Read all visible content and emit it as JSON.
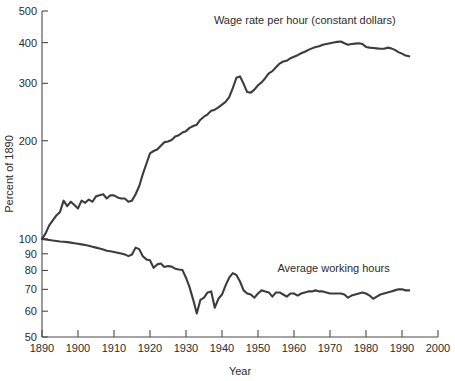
{
  "chart_data": {
    "type": "line",
    "title": "",
    "xlabel": "Year",
    "ylabel": "Percent of 1890",
    "yscale": "log",
    "xlim": [
      1890,
      2000
    ],
    "ylim": [
      50,
      500
    ],
    "grid": false,
    "legend_position": "inline-annotation",
    "xticks": [
      1890,
      1900,
      1910,
      1920,
      1930,
      1940,
      1950,
      1960,
      1970,
      1980,
      1990,
      2000
    ],
    "xtick_labels": [
      "1890",
      "1900",
      "1910",
      "1920",
      "1930",
      "1940",
      "1950",
      "1960",
      "1970",
      "1980",
      "1990",
      "2000"
    ],
    "yticks": [
      50,
      60,
      70,
      80,
      90,
      100,
      200,
      300,
      400,
      500
    ],
    "ytick_labels": [
      "50",
      "60",
      "70",
      "80",
      "90",
      "100",
      "200",
      "300",
      "400",
      "500"
    ],
    "series": [
      {
        "name": "Wage rate per hour (constant dollars)",
        "color": "#3c3c3c",
        "label_x": 1963,
        "label_y": 455,
        "x": [
          1890,
          1891,
          1892,
          1893,
          1894,
          1895,
          1896,
          1897,
          1898,
          1899,
          1900,
          1901,
          1902,
          1903,
          1904,
          1905,
          1906,
          1907,
          1908,
          1909,
          1910,
          1911,
          1912,
          1913,
          1914,
          1915,
          1916,
          1917,
          1918,
          1919,
          1920,
          1921,
          1922,
          1923,
          1924,
          1925,
          1926,
          1927,
          1928,
          1929,
          1930,
          1931,
          1932,
          1933,
          1934,
          1935,
          1936,
          1937,
          1938,
          1939,
          1940,
          1941,
          1942,
          1943,
          1944,
          1945,
          1946,
          1947,
          1948,
          1949,
          1950,
          1951,
          1952,
          1953,
          1954,
          1955,
          1956,
          1957,
          1958,
          1959,
          1960,
          1961,
          1962,
          1963,
          1964,
          1965,
          1966,
          1967,
          1968,
          1969,
          1970,
          1971,
          1972,
          1973,
          1974,
          1975,
          1976,
          1977,
          1978,
          1979,
          1980,
          1981,
          1982,
          1983,
          1984,
          1985,
          1986,
          1987,
          1988,
          1989,
          1990,
          1991,
          1992
        ],
        "y": [
          100,
          104,
          110,
          114,
          118,
          121,
          131,
          126,
          130,
          127,
          124,
          131,
          129,
          132,
          130,
          135,
          136,
          137,
          133,
          136,
          136,
          134,
          133,
          133,
          130,
          131,
          137,
          145,
          158,
          170,
          183,
          186,
          188,
          193,
          198,
          199,
          201,
          206,
          208,
          212,
          214,
          219,
          222,
          224,
          232,
          237,
          241,
          247,
          249,
          253,
          258,
          263,
          272,
          290,
          312,
          315,
          299,
          282,
          281,
          287,
          296,
          302,
          311,
          322,
          327,
          336,
          345,
          350,
          352,
          358,
          362,
          366,
          371,
          375,
          380,
          384,
          388,
          390,
          394,
          396,
          398,
          400,
          402,
          403,
          398,
          394,
          396,
          397,
          398,
          396,
          388,
          386,
          385,
          384,
          383,
          383,
          386,
          384,
          380,
          374,
          370,
          365,
          363
        ]
      },
      {
        "name": "Average working hours",
        "color": "#3c3c3c",
        "label_x": 1971,
        "label_y": 79,
        "x": [
          1890,
          1891,
          1892,
          1893,
          1894,
          1895,
          1896,
          1897,
          1898,
          1899,
          1900,
          1901,
          1902,
          1903,
          1904,
          1905,
          1906,
          1907,
          1908,
          1909,
          1910,
          1911,
          1912,
          1913,
          1914,
          1915,
          1916,
          1917,
          1918,
          1919,
          1920,
          1921,
          1922,
          1923,
          1924,
          1925,
          1926,
          1927,
          1928,
          1929,
          1930,
          1931,
          1932,
          1933,
          1934,
          1935,
          1936,
          1937,
          1938,
          1939,
          1940,
          1941,
          1942,
          1943,
          1944,
          1945,
          1946,
          1947,
          1948,
          1949,
          1950,
          1951,
          1952,
          1953,
          1954,
          1955,
          1956,
          1957,
          1958,
          1959,
          1960,
          1961,
          1962,
          1963,
          1964,
          1965,
          1966,
          1967,
          1968,
          1969,
          1970,
          1971,
          1972,
          1973,
          1974,
          1975,
          1976,
          1977,
          1978,
          1979,
          1980,
          1981,
          1982,
          1983,
          1984,
          1985,
          1986,
          1987,
          1988,
          1989,
          1990,
          1991,
          1992
        ],
        "y": [
          100,
          99.6,
          99.2,
          98.8,
          98.5,
          98.2,
          98,
          97.7,
          97.4,
          97,
          96.6,
          96.2,
          95.7,
          95.2,
          94.6,
          94,
          93.4,
          92.7,
          92,
          91.6,
          91.2,
          90.7,
          90.2,
          89.6,
          88.5,
          89.5,
          94,
          93,
          88.5,
          86.5,
          86,
          81.5,
          83.5,
          84,
          82,
          82.5,
          82.2,
          81,
          80.5,
          80.3,
          76,
          71,
          65,
          59,
          65,
          66,
          68.5,
          69,
          61.5,
          65.5,
          67.5,
          72,
          76,
          78.5,
          77.5,
          74,
          69.5,
          68,
          67.5,
          66,
          68,
          69.5,
          69,
          68.5,
          66.5,
          68.5,
          68.5,
          67.5,
          66.5,
          68,
          68,
          67,
          68,
          68.5,
          69,
          69,
          69.5,
          69,
          69,
          68.5,
          68,
          68,
          68,
          68,
          67.5,
          66,
          67,
          67.5,
          68,
          68.5,
          68,
          67,
          65.5,
          66.5,
          67.5,
          68,
          68.5,
          69,
          69.5,
          70,
          70,
          69.5,
          69.5
        ]
      }
    ]
  },
  "axis": {
    "xlabel": "Year",
    "ylabel": "Percent of 1890"
  }
}
